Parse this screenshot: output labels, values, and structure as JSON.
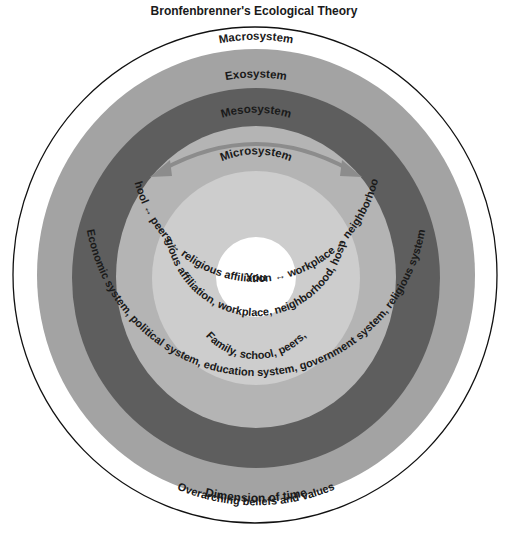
{
  "title": "Bronfenbrenner's Ecological Theory",
  "colors": {
    "chronosystem": "#ffffff",
    "macrosystem": "#a3a3a3",
    "exosystem": "#5e5e5e",
    "mesosystem": "#b4b4b4",
    "microsystem": "#cdcdcd",
    "you": "#ffffff",
    "arrow": "#8c8c8c",
    "outline": "#111111"
  },
  "layers": {
    "chronosystem": {
      "label": "Chronosystem",
      "description": "Dimension of time"
    },
    "macrosystem": {
      "label": "Macrosystem",
      "description": "Overarching beliefs and values"
    },
    "exosystem": {
      "label": "Exosystem",
      "description": "Economic system, political system, education system, government system, religious system"
    },
    "mesosystem": {
      "label": "Mesosystem",
      "description": "Family ↔ school ↔ peers ↔ religious affiliation ↔ workplace ↔ neighborhood, hospitals"
    },
    "microsystem": {
      "label": "Microsystem",
      "description_line1": "Family, school, peers,",
      "description_line2": "Religious affiliation, workplace, neighborhood, hospitals"
    },
    "center": {
      "label": "You"
    }
  }
}
